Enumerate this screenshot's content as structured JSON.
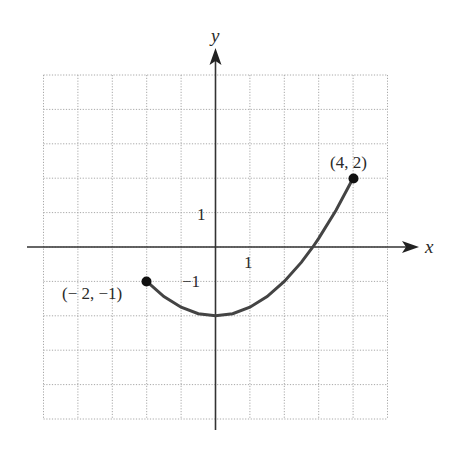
{
  "chart_data": {
    "type": "line",
    "title": "",
    "xlabel": "x",
    "ylabel": "y",
    "xlim": [
      -5,
      5
    ],
    "ylim": [
      -5,
      5
    ],
    "grid": true,
    "grid_style": "dotted",
    "tick_labels": {
      "x": [
        {
          "value": 1,
          "label": "1"
        }
      ],
      "y": [
        {
          "value": 1,
          "label": "1"
        },
        {
          "value": -1,
          "label": "−1"
        }
      ]
    },
    "series": [
      {
        "name": "curve",
        "description": "parabolic arc y = x^2/4 - 2 on [-2, 4]",
        "x": [
          -2,
          -1.5,
          -1,
          -0.5,
          0,
          0.5,
          1,
          1.5,
          2,
          2.5,
          2.83,
          3,
          3.5,
          4
        ],
        "y": [
          -1,
          -1.44,
          -1.75,
          -1.94,
          -2,
          -1.94,
          -1.75,
          -1.44,
          -1,
          -0.44,
          0,
          0.25,
          1.06,
          2
        ]
      }
    ],
    "annotations": [
      {
        "x": -2,
        "y": -1,
        "label": "(− 2, −1)",
        "marker": "filled-circle"
      },
      {
        "x": 4,
        "y": 2,
        "label": "(4, 2)",
        "marker": "filled-circle"
      }
    ],
    "legend": null
  },
  "labels": {
    "x_axis": "x",
    "y_axis": "y",
    "x_tick_1": "1",
    "y_tick_1": "1",
    "y_tick_neg1": "−1",
    "start_point": "(− 2, −1)",
    "end_point": "(4, 2)"
  },
  "colors": {
    "axis": "#333333",
    "curve": "#444444",
    "grid": "#a8a8a8",
    "point": "#111111"
  }
}
